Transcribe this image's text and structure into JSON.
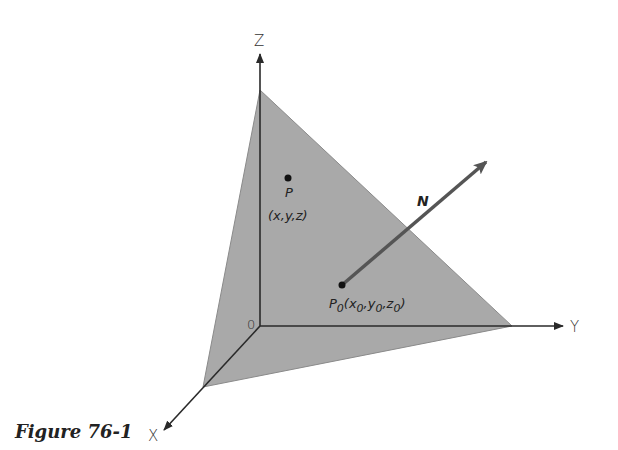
{
  "figure": {
    "caption": "Figure 76-1",
    "colors": {
      "plane_fill": "#a9a9a9",
      "axis": "#2a2a2a",
      "normal_vector": "#555555",
      "background": "#ffffff"
    },
    "axes": {
      "z_label": "Z",
      "y_label": "Y",
      "x_label": "X",
      "origin_label": "0"
    },
    "points": {
      "p": {
        "name": "P",
        "coords": "(x,y,z)"
      },
      "p0": {
        "name": "P",
        "subscript": "0",
        "coords_parts": [
          "(x",
          "0",
          ",y",
          "0",
          ",z",
          "0",
          ")"
        ]
      }
    },
    "normal_vector": {
      "label": "N"
    }
  }
}
